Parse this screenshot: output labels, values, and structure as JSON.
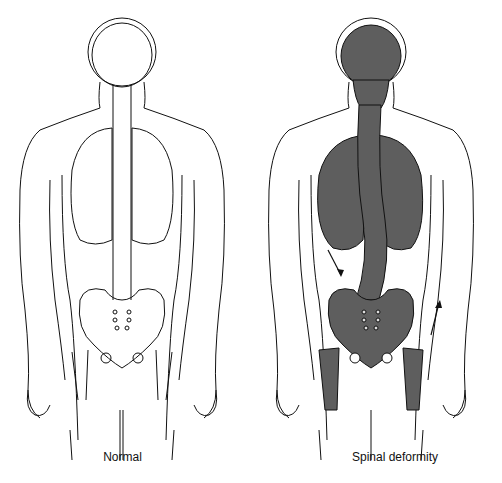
{
  "figure": {
    "panels": [
      {
        "id": "normal",
        "caption": "Normal",
        "fill_color": "#ffffff",
        "spine": "straight"
      },
      {
        "id": "deformity",
        "caption": "Spinal deformity",
        "fill_color": "#5e5e5e",
        "spine": "curved"
      }
    ],
    "annotations": [
      "arrow-down-left-torso",
      "arrow-up-right-hip"
    ],
    "stroke_color": "#111111"
  }
}
